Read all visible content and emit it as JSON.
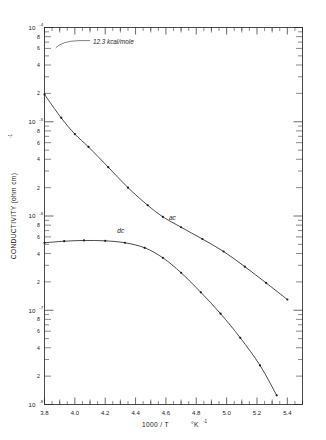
{
  "chart_data": {
    "type": "line",
    "title": "",
    "xlabel": "1000/T   °K⁻¹",
    "ylabel": "CONDUCTIVITY (ohm cm)⁻¹",
    "xlim": [
      3.8,
      5.5
    ],
    "ylim": [
      1e-08,
      0.0001
    ],
    "yscale": "log",
    "xscale": "linear",
    "grid": false,
    "legend": "inline-labels",
    "x_major_ticks": [
      3.8,
      4.0,
      4.2,
      4.4,
      4.6,
      4.8,
      5.0,
      5.2,
      5.4
    ],
    "x_tick_labels": [
      "3.8",
      "4.0",
      "4.2",
      "4.4",
      "4.6",
      "4.8",
      "5.0",
      "5.2",
      "5.4"
    ],
    "x_minor_step": 0.05,
    "y_decades": [
      {
        "label": "10",
        "exponent": "-4",
        "value": 0.0001
      },
      {
        "label": "10",
        "exponent": "-5",
        "value": 1e-05
      },
      {
        "label": "10",
        "exponent": "-6",
        "value": 1e-06
      },
      {
        "label": "10",
        "exponent": "-7",
        "value": 1e-07
      },
      {
        "label": "10",
        "exponent": "-8",
        "value": 1e-08
      }
    ],
    "y_minor_labels": [
      "8",
      "6",
      "4",
      "2"
    ],
    "annotations": [
      {
        "text": "12.3 kcal/mole",
        "x": 4.12,
        "y": 7e-05,
        "kind": "activation-energy-callout"
      }
    ],
    "series": [
      {
        "name": "ac",
        "label": "ac",
        "label_x": 4.62,
        "label_y": 9e-07,
        "points": [
          {
            "x": 3.8,
            "y": 1.95e-05
          },
          {
            "x": 3.91,
            "y": 1.1e-05
          },
          {
            "x": 4.0,
            "y": 7.4e-06
          },
          {
            "x": 4.09,
            "y": 5.4e-06
          },
          {
            "x": 4.22,
            "y": 3.3e-06
          },
          {
            "x": 4.35,
            "y": 2e-06
          },
          {
            "x": 4.48,
            "y": 1.3e-06
          },
          {
            "x": 4.58,
            "y": 9.8e-07
          },
          {
            "x": 4.7,
            "y": 7.6e-07
          },
          {
            "x": 4.84,
            "y": 5.7e-07
          },
          {
            "x": 4.98,
            "y": 4.2e-07
          },
          {
            "x": 5.12,
            "y": 2.9e-07
          },
          {
            "x": 5.26,
            "y": 1.95e-07
          },
          {
            "x": 5.4,
            "y": 1.3e-07
          }
        ]
      },
      {
        "name": "dc",
        "label": "dc",
        "label_x": 4.28,
        "label_y": 6.6e-07,
        "points": [
          {
            "x": 3.8,
            "y": 5.2e-07
          },
          {
            "x": 3.93,
            "y": 5.4e-07
          },
          {
            "x": 4.06,
            "y": 5.5e-07
          },
          {
            "x": 4.2,
            "y": 5.45e-07
          },
          {
            "x": 4.33,
            "y": 5.2e-07
          },
          {
            "x": 4.46,
            "y": 4.6e-07
          },
          {
            "x": 4.58,
            "y": 3.6e-07
          },
          {
            "x": 4.7,
            "y": 2.5e-07
          },
          {
            "x": 4.83,
            "y": 1.55e-07
          },
          {
            "x": 4.96,
            "y": 9.2e-08
          },
          {
            "x": 5.09,
            "y": 5.1e-08
          },
          {
            "x": 5.22,
            "y": 2.6e-08
          },
          {
            "x": 5.33,
            "y": 1.25e-08
          }
        ]
      }
    ]
  },
  "figure": {
    "y_axis_title": "CONDUCTIVITY (ohm cm)",
    "y_axis_title_exp": "-1",
    "x_axis_title_main": "1000 / T",
    "x_axis_title_unit": "°K",
    "x_axis_title_unit_exp": "-1",
    "series_label_ac": "ac",
    "series_label_dc": "dc",
    "annotation_energy": "12.3 kcal/mole",
    "decade_labels": [
      "10",
      "10",
      "10",
      "10",
      "10"
    ],
    "decade_exponents": [
      "-4",
      "-5",
      "-6",
      "-7",
      "-8"
    ],
    "minor_labels": [
      "8",
      "6",
      "4",
      "2"
    ],
    "x_labels": [
      "3.8",
      "4.0",
      "4.2",
      "4.4",
      "4.6",
      "4.8",
      "5.0",
      "5.2",
      "5.4"
    ]
  }
}
